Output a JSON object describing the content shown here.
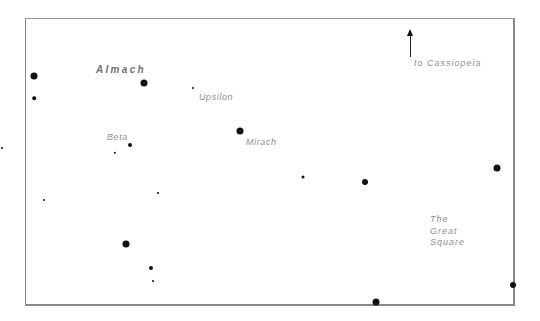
{
  "diagram": {
    "type": "star-chart",
    "title": "",
    "labels": {
      "almach": "Almach",
      "upsilon": "Upsilon",
      "beta": "Beta",
      "mirach": "Mirach",
      "cassiopeia": "to  Cassiopeia",
      "great_square": "The\nGreat\nSquare"
    },
    "arrow": {
      "direction": "up",
      "points_to": "Cassiopeia"
    },
    "colors": {
      "star": "#111111",
      "label": "#8f8f8f",
      "frame": "#8a8a8a",
      "background": "#ffffff"
    },
    "stars": [
      {
        "x": 34,
        "y": 76,
        "r": 3.5
      },
      {
        "x": 34,
        "y": 98,
        "r": 1.8
      },
      {
        "x": 144,
        "y": 83,
        "r": 3.5
      },
      {
        "x": 193,
        "y": 88,
        "r": 1.0
      },
      {
        "x": 240,
        "y": 131,
        "r": 3.5
      },
      {
        "x": 130,
        "y": 145,
        "r": 2.0
      },
      {
        "x": 115,
        "y": 153,
        "r": 1.2
      },
      {
        "x": 158,
        "y": 193,
        "r": 1.0
      },
      {
        "x": 44,
        "y": 200,
        "r": 1.0
      },
      {
        "x": 303,
        "y": 177,
        "r": 1.5
      },
      {
        "x": 365,
        "y": 182,
        "r": 3.0
      },
      {
        "x": 497,
        "y": 168,
        "r": 3.5
      },
      {
        "x": 126,
        "y": 244,
        "r": 3.5
      },
      {
        "x": 151,
        "y": 268,
        "r": 2.0
      },
      {
        "x": 153,
        "y": 281,
        "r": 1.0
      },
      {
        "x": 376,
        "y": 302,
        "r": 3.5
      },
      {
        "x": 513,
        "y": 285,
        "r": 3.0
      },
      {
        "x": 2,
        "y": 148,
        "r": 1.0
      }
    ]
  }
}
